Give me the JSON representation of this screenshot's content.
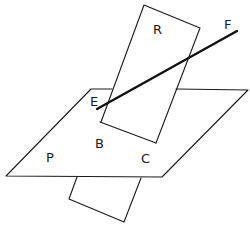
{
  "diagram": {
    "labels": {
      "R": "R",
      "F": "F",
      "E": "E",
      "B": "B",
      "C": "C",
      "P": "P"
    },
    "colors": {
      "stroke": "#1a1a1a",
      "background": "#ffffff"
    }
  }
}
